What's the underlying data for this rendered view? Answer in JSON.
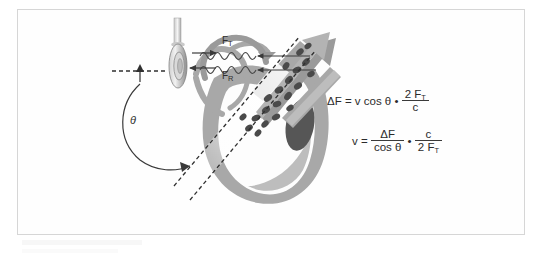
{
  "figure": {
    "domain": "medical-physics-diagram",
    "border_color": "#d6d6d6",
    "background": "#ffffff"
  },
  "labels": {
    "transmitted_frequency": "F",
    "transmitted_frequency_sub": "T",
    "received_frequency": "F",
    "received_frequency_sub": "R",
    "angle": "θ"
  },
  "equations": {
    "doppler_shift": {
      "lead": "ΔF = v cos θ  •",
      "numerator": "2 F",
      "numerator_sub": "T",
      "denominator": "c"
    },
    "velocity": {
      "lead": "v =",
      "frac1_num": "ΔF",
      "frac1_den": "cos θ",
      "operator": "•",
      "frac2_num": "c",
      "frac2_den": "2 F",
      "frac2_den_sub": "T"
    }
  },
  "elements": {
    "transducer": "ultrasound-transducer-probe",
    "cable": "transducer-cable",
    "waves": "ultrasound-sine-waves",
    "heart": "heart-cross-section",
    "blood_cells": "red-blood-cells-in-aorta",
    "flow_arrow": "blood-flow-arrow",
    "beam_lines": "dashed-ultrasound-beam",
    "baseline": "dashed-horizontal-reference-line",
    "angle_arc": "angle-theta-arc-arrow"
  },
  "colors": {
    "myocardium": "#a8a8a8",
    "myocardium_light": "#bdbdbd",
    "dark_structure": "#565656",
    "blood_cells": "#4a4a4a",
    "flow_arrow": "#9a9a9a",
    "wave_stroke": "#4a4a4a",
    "text": "#2b2b2b",
    "border": "#d6d6d6"
  }
}
